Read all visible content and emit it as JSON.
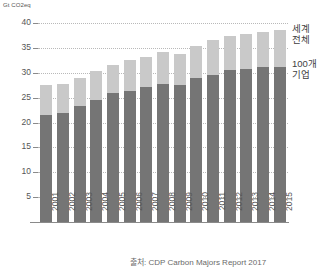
{
  "chart_data": {
    "type": "bar",
    "title": "",
    "subtitle": "",
    "xlabel": "",
    "ylabel": "Gt CO2eq",
    "unit_label": "Gt CO2eq",
    "stacked": true,
    "grid": true,
    "legend_position": "right",
    "ylim": [
      0,
      40
    ],
    "yticks": [
      40,
      35,
      30,
      25,
      20,
      15,
      10,
      5
    ],
    "ytick_labels": [
      "40",
      "35",
      "30",
      "25",
      "20",
      "15",
      "10",
      "5"
    ],
    "categories": [
      "2001",
      "2002",
      "2003",
      "2004",
      "2005",
      "2006",
      "2007",
      "2008",
      "2009",
      "2010",
      "2011",
      "2012",
      "2013",
      "2014",
      "2015"
    ],
    "series": [
      {
        "name": "100개 기업",
        "color": "#757575",
        "values": [
          21.5,
          22.0,
          23.3,
          24.5,
          25.9,
          26.4,
          27.1,
          27.8,
          27.6,
          29.0,
          29.6,
          30.5,
          30.7,
          31.2,
          31.2
        ]
      },
      {
        "name": "세계 전체",
        "color": "#c9c9c9",
        "values": [
          6.0,
          5.7,
          5.7,
          5.8,
          5.7,
          6.2,
          6.1,
          6.3,
          6.2,
          6.4,
          6.9,
          6.9,
          7.0,
          7.0,
          7.3
        ]
      }
    ],
    "totals": [
      27.5,
      27.7,
      29.0,
      30.3,
      31.6,
      32.6,
      33.2,
      34.1,
      33.8,
      35.4,
      36.5,
      37.4,
      37.7,
      38.2,
      38.5
    ]
  },
  "legend": {
    "world_line1": "세계",
    "world_line2": "전체",
    "companies_line1": "100개",
    "companies_line2": "기업"
  },
  "caption": {
    "source": "출처: CDP Carbon Majors Report 2017"
  },
  "colors": {
    "company_bar": "#757575",
    "world_bar": "#c9c9c9",
    "gridline": "#b9b9b9",
    "axis": "#8a8a8a",
    "text": "#555555"
  }
}
